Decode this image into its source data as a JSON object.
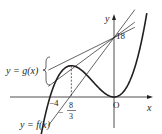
{
  "figure": {
    "curve_label": "y = f(x)",
    "tangent_group_label": "y = g(x)",
    "axis_x_label": "x",
    "axis_y_label": "y",
    "origin_label": "O",
    "y_intercept_label": "18",
    "root_label": "−4",
    "local_max_x_numerator": "8",
    "local_max_x_denominator": "3",
    "local_max_x_sign": "−",
    "function": "f(x) = x^2 (x + 4)",
    "roots": [
      -4,
      0
    ],
    "local_max_x": -2.6667,
    "common_point": [
      0,
      18
    ],
    "tangent_line_count": 3,
    "colors": {
      "ink": "#231f20",
      "background": "#ffffff"
    }
  }
}
